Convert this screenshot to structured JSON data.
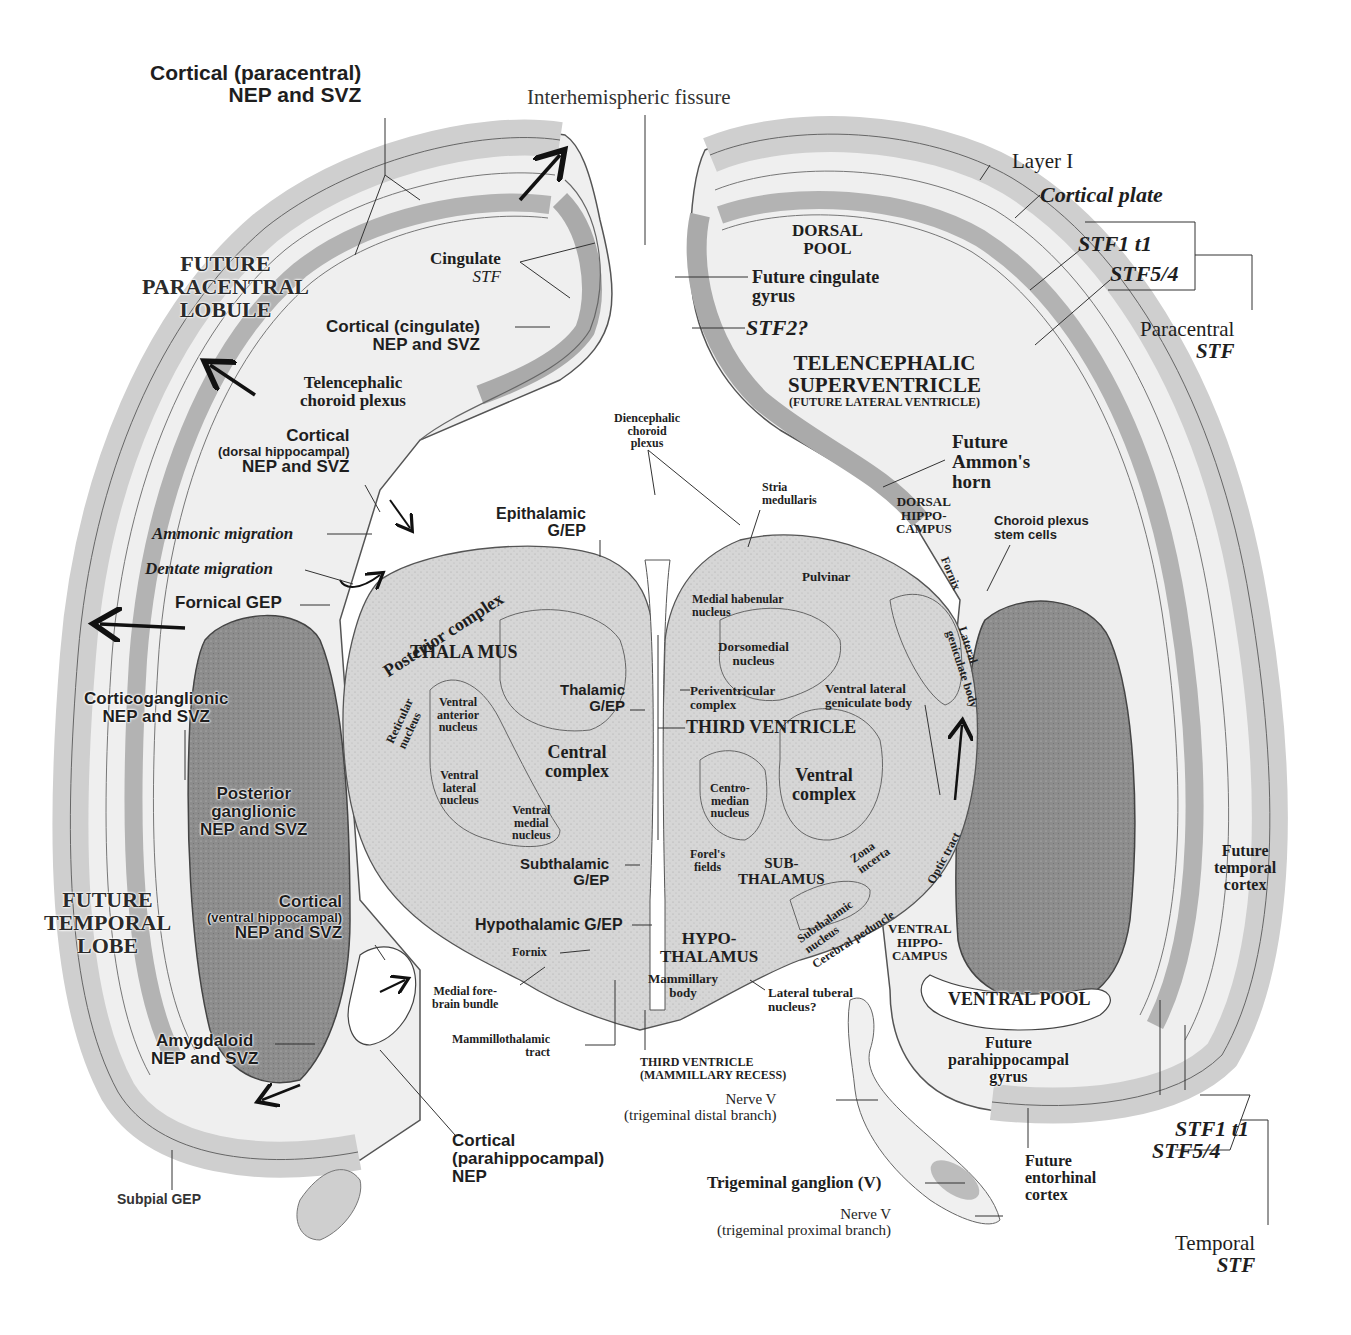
{
  "colors": {
    "background": "#ffffff",
    "tissue_light": "#ececec",
    "tissue_mid": "#c8c8c8",
    "tissue_dark": "#8a8a8a",
    "ventricle": "#ffffff",
    "outline": "#555555",
    "text": "#1e1e1e"
  },
  "labels": {
    "cortical_paracentral": [
      "Cortical (paracentral)",
      "NEP and SVZ"
    ],
    "interhemispheric_fissure": "Interhemispheric fissure",
    "layer_i": "Layer I",
    "cortical_plate": "Cortical plate",
    "stf1_t1_top": "STF1 t1",
    "stf5_4_top": "STF5/4",
    "paracentral_stf": [
      "Paracentral",
      "STF"
    ],
    "future_paracentral_lobule": [
      "FUTURE",
      "PARACENTRAL",
      "LOBULE"
    ],
    "cingulate_stf": [
      "Cingulate",
      "STF"
    ],
    "cortical_cingulate": [
      "Cortical (cingulate)",
      "NEP and SVZ"
    ],
    "dorsal_pool": [
      "DORSAL",
      "POOL"
    ],
    "future_cingulate_gyrus": [
      "Future cingulate",
      "gyrus"
    ],
    "stf2": "STF2?",
    "telencephalic_superventricle": [
      "TELENCEPHALIC",
      "SUPERVENTRICLE"
    ],
    "future_lateral_ventricle": "(FUTURE LATERAL VENTRICLE)",
    "telencephalic_choroid_plexus": [
      "Telencephalic",
      "choroid plexus"
    ],
    "cortical_dorsal_hippocampal": [
      "Cortical",
      "(dorsal hippocampal)",
      "NEP and SVZ"
    ],
    "diencephalic_choroid_plexus": [
      "Diencephalic",
      "choroid",
      "plexus"
    ],
    "future_ammons_horn": [
      "Future",
      "Ammon's",
      "horn"
    ],
    "dorsal_hippocampus": [
      "DORSAL",
      "HIPPO-",
      "CAMPUS"
    ],
    "choroid_plexus_stem_cells": [
      "Choroid plexus",
      "stem cells"
    ],
    "stria_medullaris": [
      "Stria",
      "medullaris"
    ],
    "epithalamic_gep": [
      "Epithalamic",
      "G/EP"
    ],
    "ammonic_migration": "Ammonic migration",
    "dentate_migration": "Dentate migration",
    "fornical_gep": "Fornical GEP",
    "posterior_complex": "Posterior complex",
    "pulvinar": "Pulvinar",
    "medial_habenular_nucleus": [
      "Medial habenular",
      "nucleus"
    ],
    "fornix_upper": "Fornix",
    "lateral_geniculate_body": [
      "Lateral",
      "geniculate body"
    ],
    "thalamus": "THALA MUS",
    "dorsomedial_nucleus": [
      "Dorsomedial",
      "nucleus"
    ],
    "corticoganglionic": [
      "Corticoganglionic",
      "NEP and SVZ"
    ],
    "reticular_nucleus": [
      "Reticular",
      "nucleus"
    ],
    "ventral_anterior_nucleus": [
      "Ventral",
      "anterior",
      "nucleus"
    ],
    "thalamic_gep": [
      "Thalamic",
      "G/EP"
    ],
    "periventricular_complex": [
      "Periventricular",
      "complex"
    ],
    "ventral_lateral_geniculate_body": [
      "Ventral lateral",
      "geniculate body"
    ],
    "third_ventricle": "THIRD VENTRICLE",
    "central_complex": [
      "Central",
      "complex"
    ],
    "ventral_lateral_nucleus": [
      "Ventral",
      "lateral",
      "nucleus"
    ],
    "ventral_medial_nucleus": [
      "Ventral",
      "medial",
      "nucleus"
    ],
    "centromedian_nucleus": [
      "Centro-",
      "median",
      "nucleus"
    ],
    "ventral_complex": [
      "Ventral",
      "complex"
    ],
    "posterior_ganglionic": [
      "Posterior",
      "ganglionic",
      "NEP and SVZ"
    ],
    "subthalamic_gep": [
      "Subthalamic",
      "G/EP"
    ],
    "forels_fields": [
      "Forel's",
      "fields"
    ],
    "subthalamus": [
      "SUB-",
      "THALAMUS"
    ],
    "zona_incerta": [
      "Zona",
      "incerta"
    ],
    "optic_tract": "Optic tract",
    "future_temporal_cortex": [
      "Future",
      "temporal",
      "cortex"
    ],
    "future_temporal_lobe": [
      "FUTURE",
      "TEMPORAL",
      "LOBE"
    ],
    "cortical_ventral_hippocampal": [
      "Cortical",
      "(ventral hippocampal)",
      "NEP and SVZ"
    ],
    "hypothalamic_gep": "Hypothalamic G/EP",
    "hypothalamus": [
      "HYPO-",
      "THALAMUS"
    ],
    "subthalamic_nucleus": [
      "Subthalamic",
      "nucleus"
    ],
    "cerebral_peduncle": "Cerebral peduncle",
    "ventral_hippocampus": [
      "VENTRAL",
      "HIPPO-",
      "CAMPUS"
    ],
    "fornix_lower": "Fornix",
    "medial_forebrain_bundle": [
      "Medial fore-",
      "brain bundle"
    ],
    "mammillary_body": [
      "Mammillary",
      "body"
    ],
    "lateral_tuberal_nucleus": [
      "Lateral tuberal",
      "nucleus?"
    ],
    "ventral_pool": "VENTRAL POOL",
    "amygdaloid": [
      "Amygdaloid",
      "NEP and SVZ"
    ],
    "mammillothalamic_tract": [
      "Mammillothalamic",
      "tract"
    ],
    "third_ventricle_mammillary": [
      "THIRD VENTRICLE",
      "(MAMMILLARY RECESS)"
    ],
    "future_parahippocampal_gyrus": [
      "Future",
      "parahippocampal",
      "gyrus"
    ],
    "nerve_v_distal": [
      "Nerve V",
      "(trigeminal distal branch)"
    ],
    "cortical_parahippocampal": [
      "Cortical",
      "(parahippocampal)",
      "NEP"
    ],
    "stf1_t1_bottom": "STF1 t1",
    "stf5_4_bottom": "STF5/4",
    "future_entorhinal_cortex": [
      "Future",
      "entorhinal",
      "cortex"
    ],
    "trigeminal_ganglion": "Trigeminal ganglion (V)",
    "subpial_gep": "Subpial GEP",
    "nerve_v_proximal": [
      "Nerve V",
      "(trigeminal proximal branch)"
    ],
    "temporal_stf": [
      "Temporal",
      "STF"
    ]
  }
}
